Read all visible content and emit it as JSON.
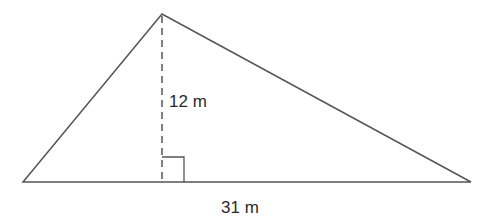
{
  "diagram": {
    "type": "triangle-with-altitude",
    "labels": {
      "height": "12 m",
      "base": "31 m"
    },
    "colors": {
      "line": "#555555",
      "text": "#2a2a2a",
      "background": "#ffffff"
    }
  }
}
